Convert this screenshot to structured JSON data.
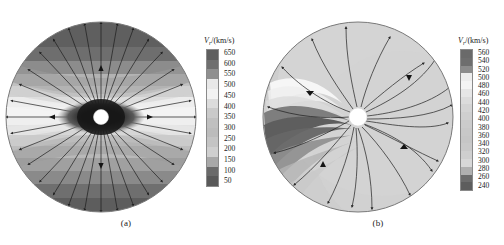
{
  "figure": {
    "caption_a": "(a)",
    "caption_b": "(b)"
  },
  "panels": [
    {
      "id": "a",
      "label": "(a)",
      "colorbar": {
        "title_var": "V",
        "title_sub": "r",
        "title_unit": "/(km/s)",
        "title_full": "Vr/(km/s)",
        "ticks": [
          "650",
          "600",
          "550",
          "500",
          "450",
          "400",
          "350",
          "300",
          "250",
          "200",
          "150",
          "100",
          "50"
        ],
        "unit": "km/s",
        "min": 50,
        "max": 650,
        "step": 50,
        "swatches": [
          "#5f5f5f",
          "#6f6f6f",
          "#8f8f8f",
          "#e8e8e8",
          "#f2f2f2",
          "#dcdcdc",
          "#cacaca",
          "#c0c0c0",
          "#bcbcbc",
          "#c4c4c4",
          "#cfcfcf",
          "#a8a8a8",
          "#6a6a6a",
          "#595959"
        ]
      }
    },
    {
      "id": "b",
      "label": "(b)",
      "colorbar": {
        "title_var": "V",
        "title_sub": "r",
        "title_unit": "/(km/s)",
        "title_full": "Vr/(km/s)",
        "ticks": [
          "560",
          "540",
          "520",
          "500",
          "480",
          "460",
          "440",
          "420",
          "400",
          "380",
          "360",
          "340",
          "320",
          "300",
          "280",
          "260",
          "240"
        ],
        "unit": "km/s",
        "min": 240,
        "max": 560,
        "step": 20,
        "swatches": [
          "#6a6a6a",
          "#6e6e6e",
          "#8c8c8c",
          "#ededed",
          "#f4f4f4",
          "#e6e6e6",
          "#dcdcdc",
          "#d4d4d4",
          "#cfcfcf",
          "#cbcbcb",
          "#c8c8c8",
          "#c6c6c6",
          "#c9c9c9",
          "#cfcfcf",
          "#d8d8d8",
          "#b0b0b0",
          "#6c6c6c",
          "#5d5d5d"
        ]
      }
    }
  ],
  "chart_data": [
    {
      "type": "heatmap",
      "panel": "(a)",
      "title": "Vr/(km/s)",
      "projection": "polar-disk",
      "description": "Solar wind radial speed map on a circular heliospheric cut with radial streamlines emanating from the Sun at the centre; latitudinal banding of fast and slow wind.",
      "colorbar_label": "Vr/(km/s)",
      "colorbar_ticks": [
        650,
        600,
        550,
        500,
        450,
        400,
        350,
        300,
        250,
        200,
        150,
        100,
        50
      ],
      "vmin": 50,
      "vmax": 650,
      "tick_step": 50,
      "colormap": "grayscale",
      "streamlines": 36,
      "streamline_style": "radial-with-arrowheads",
      "center_marker": "white-circle-sun",
      "bands": [
        {
          "label": "polar fast wind (top)",
          "value": 650
        },
        {
          "label": "mid-latitude transition (upper)",
          "value": 550
        },
        {
          "label": "slow streamer belt (upper)",
          "value": 450
        },
        {
          "label": "equatorial current sheet",
          "value": 350
        },
        {
          "label": "slow streamer belt (lower)",
          "value": 450
        },
        {
          "label": "mid-latitude transition (lower)",
          "value": 550
        },
        {
          "label": "polar fast wind (bottom)",
          "value": 650
        }
      ],
      "xlabel": "",
      "ylabel": "",
      "grid": false,
      "legend_position": "right"
    },
    {
      "type": "heatmap",
      "panel": "(b)",
      "title": "Vr/(km/s)",
      "projection": "polar-disk",
      "description": "Equatorial-plane solar wind radial speed map with Parker-spiral streamlines winding out from the Sun; a dark low-speed stream occupies the left sector.",
      "colorbar_label": "Vr/(km/s)",
      "colorbar_ticks": [
        560,
        540,
        520,
        500,
        480,
        460,
        440,
        420,
        400,
        380,
        360,
        340,
        320,
        300,
        280,
        260,
        240
      ],
      "vmin": 240,
      "vmax": 560,
      "tick_step": 20,
      "colormap": "grayscale",
      "streamlines": 18,
      "streamline_style": "parker-spiral-with-arrowheads",
      "center_marker": "white-circle-sun",
      "features": [
        {
          "label": "ambient wind (background)",
          "value": 420
        },
        {
          "label": "fast stream ridge (left rim)",
          "value": 540
        },
        {
          "label": "slow stream core (left sector)",
          "value": 260
        },
        {
          "label": "compression interface",
          "value": 300
        }
      ],
      "xlabel": "",
      "ylabel": "",
      "grid": false,
      "legend_position": "right"
    }
  ]
}
